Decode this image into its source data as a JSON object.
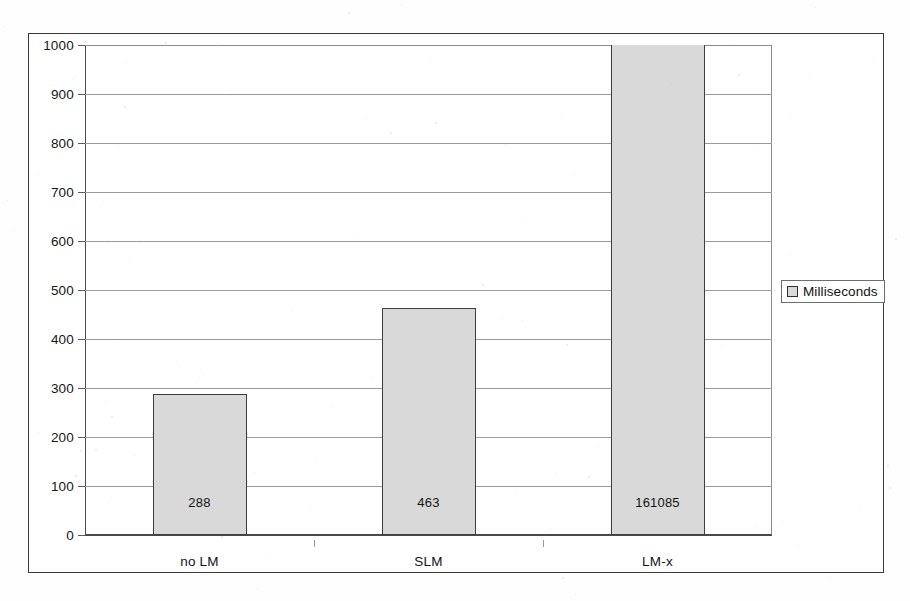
{
  "chart_data": {
    "type": "bar",
    "title": "",
    "xlabel": "",
    "ylabel": "",
    "categories": [
      "no LM",
      "SLM",
      "LM-x"
    ],
    "values": [
      288,
      463,
      161085
    ],
    "display_values": [
      "288",
      "463",
      "161085"
    ],
    "series": [
      {
        "name": "Milliseconds",
        "values": [
          288,
          463,
          161085
        ]
      }
    ],
    "ylim": [
      0,
      1000
    ],
    "ytick_labels": [
      "0",
      "100",
      "200",
      "300",
      "400",
      "500",
      "600",
      "700",
      "800",
      "900",
      "1000"
    ],
    "ytick_values": [
      0,
      100,
      200,
      300,
      400,
      500,
      600,
      700,
      800,
      900,
      1000
    ],
    "grid": true,
    "grid_axis": "y",
    "legend": {
      "position": "right",
      "entries": [
        {
          "label": "Milliseconds",
          "swatch_color": "#d9d9d9"
        }
      ]
    },
    "colors": {
      "bar_fill": "#d9d9d9",
      "bar_border": "#3d3d3d",
      "gridline": "#9b9b9b",
      "axis": "#4a4a4a",
      "frame": "#3a3a3a",
      "background": "#ffffff",
      "text": "#141414"
    }
  }
}
